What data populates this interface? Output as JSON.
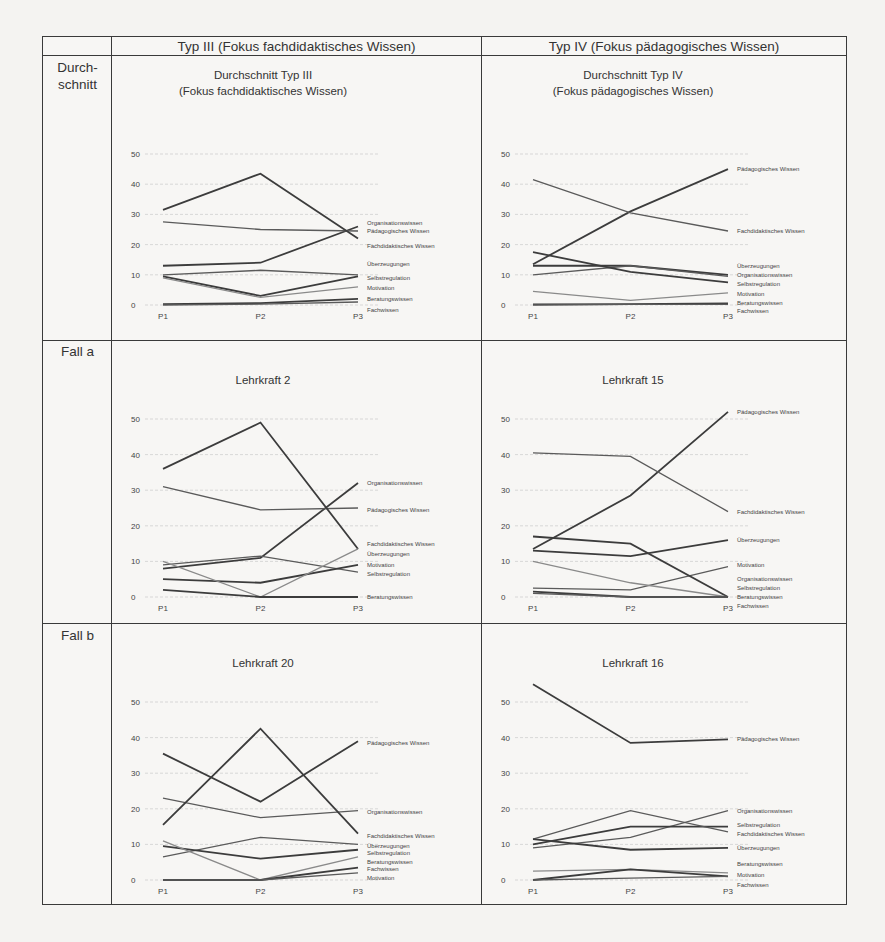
{
  "table": {
    "column_headers": [
      "Typ III (Fokus fachdidaktisches Wissen)",
      "Typ IV (Fokus pädagogisches Wissen)"
    ],
    "row_headers": [
      "Durch-\nschnitt",
      "Fall a",
      "Fall b"
    ]
  },
  "chart_data": [
    {
      "id": "avg_typ3",
      "type": "line",
      "title": "Durchschnitt Typ III",
      "subtitle": "(Fokus fachdidaktisches Wissen)",
      "categories": [
        "P1",
        "P2",
        "P3"
      ],
      "ylim": [
        0,
        50
      ],
      "yticks": [
        0,
        10,
        20,
        30,
        40,
        50
      ],
      "grid": true,
      "legend_position": "right-inline",
      "series": [
        {
          "name": "Organisationswissen",
          "values": [
            13,
            14,
            26
          ],
          "label_y": 27
        },
        {
          "name": "Pädagogisches Wissen",
          "values": [
            27.5,
            25,
            24.5
          ],
          "label_y": 24.5
        },
        {
          "name": "Fachdidaktisches Wissen",
          "values": [
            31.5,
            43.5,
            22
          ],
          "label_y": 19.5
        },
        {
          "name": "Überzeugungen",
          "values": [
            10,
            11.5,
            10
          ],
          "label_y": 13.5
        },
        {
          "name": "Selbstregulation",
          "values": [
            9.5,
            3,
            9.5
          ],
          "label_y": 9
        },
        {
          "name": "Motivation",
          "values": [
            9,
            2.5,
            6
          ],
          "label_y": 5.5
        },
        {
          "name": "Beratungswissen",
          "values": [
            0.3,
            0.6,
            2
          ],
          "label_y": 2
        },
        {
          "name": "Fachwissen",
          "values": [
            0,
            0.3,
            1
          ],
          "label_y": -1.5
        }
      ]
    },
    {
      "id": "avg_typ4",
      "type": "line",
      "title": "Durchschnitt Typ IV",
      "subtitle": "(Fokus pädagogisches Wissen)",
      "categories": [
        "P1",
        "P2",
        "P3"
      ],
      "ylim": [
        0,
        50
      ],
      "yticks": [
        0,
        10,
        20,
        30,
        40,
        50
      ],
      "grid": true,
      "legend_position": "right-inline",
      "series": [
        {
          "name": "Pädagogisches Wissen",
          "values": [
            13.5,
            31,
            45
          ],
          "label_y": 45
        },
        {
          "name": "Fachdidaktisches Wissen",
          "values": [
            41.5,
            30.5,
            24.5
          ],
          "label_y": 24.5
        },
        {
          "name": "Überzeugungen",
          "values": [
            13,
            13,
            10
          ],
          "label_y": 13
        },
        {
          "name": "Organisationswissen",
          "values": [
            10,
            13,
            9.5
          ],
          "label_y": 10
        },
        {
          "name": "Selbstregulation",
          "values": [
            17.5,
            11,
            7.5
          ],
          "label_y": 7
        },
        {
          "name": "Motivation",
          "values": [
            4.5,
            1.5,
            4
          ],
          "label_y": 3.5
        },
        {
          "name": "Beratungswissen",
          "values": [
            0.2,
            0.3,
            0.5
          ],
          "label_y": 0.5
        },
        {
          "name": "Fachwissen",
          "values": [
            0,
            0.2,
            0.2
          ],
          "label_y": -2
        }
      ]
    },
    {
      "id": "lehrkraft_2",
      "type": "line",
      "title": "Lehrkraft 2",
      "categories": [
        "P1",
        "P2",
        "P3"
      ],
      "ylim": [
        0,
        50
      ],
      "yticks": [
        0,
        10,
        20,
        30,
        40,
        50
      ],
      "grid": true,
      "legend_position": "right-inline",
      "series": [
        {
          "name": "Organisationswissen",
          "values": [
            8,
            11,
            32
          ],
          "label_y": 32
        },
        {
          "name": "Pädagogisches Wissen",
          "values": [
            31,
            24.5,
            25
          ],
          "label_y": 24.5
        },
        {
          "name": "Fachdidaktisches Wissen",
          "values": [
            36,
            49,
            13.5
          ],
          "label_y": 15
        },
        {
          "name": "Überzeugungen",
          "values": [
            9,
            11.5,
            7
          ],
          "label_y": 12
        },
        {
          "name": "Motivation",
          "values": [
            5,
            4,
            9
          ],
          "label_y": 9
        },
        {
          "name": "Selbstregulation",
          "values": [
            10,
            0,
            13.5
          ],
          "label_y": 6.5
        },
        {
          "name": "Beratungswissen",
          "values": [
            2,
            0,
            0
          ],
          "label_y": 0
        }
      ]
    },
    {
      "id": "lehrkraft_15",
      "type": "line",
      "title": "Lehrkraft 15",
      "categories": [
        "P1",
        "P2",
        "P3"
      ],
      "ylim": [
        0,
        50
      ],
      "yticks": [
        0,
        10,
        20,
        30,
        40,
        50
      ],
      "grid": true,
      "legend_position": "right-inline",
      "series": [
        {
          "name": "Pädagogisches Wissen",
          "values": [
            13.5,
            28.5,
            52
          ],
          "label_y": 52
        },
        {
          "name": "Fachdidaktisches Wissen",
          "values": [
            40.5,
            39.5,
            24
          ],
          "label_y": 24
        },
        {
          "name": "Überzeugungen",
          "values": [
            13,
            11.5,
            16
          ],
          "label_y": 16
        },
        {
          "name": "Motivation",
          "values": [
            2.5,
            2,
            8.5
          ],
          "label_y": 9
        },
        {
          "name": "Organisationswissen",
          "values": [
            17,
            15,
            0
          ],
          "label_y": 5
        },
        {
          "name": "Selbstregulation",
          "values": [
            10,
            4,
            0
          ],
          "label_y": 2.5
        },
        {
          "name": "Beratungswissen",
          "values": [
            1.5,
            0,
            0
          ],
          "label_y": 0
        },
        {
          "name": "Fachwissen",
          "values": [
            1,
            0,
            0
          ],
          "label_y": -2.5
        }
      ]
    },
    {
      "id": "lehrkraft_20",
      "type": "line",
      "title": "Lehrkraft 20",
      "categories": [
        "P1",
        "P2",
        "P3"
      ],
      "ylim": [
        0,
        50
      ],
      "yticks": [
        0,
        10,
        20,
        30,
        40,
        50
      ],
      "grid": true,
      "legend_position": "right-inline",
      "series": [
        {
          "name": "Pädagogisches Wissen",
          "values": [
            35.5,
            22,
            39
          ],
          "label_y": 38.5
        },
        {
          "name": "Organisationswissen",
          "values": [
            23,
            17.5,
            19.5
          ],
          "label_y": 19
        },
        {
          "name": "Fachdidaktisches Wissen",
          "values": [
            15.5,
            42.5,
            13
          ],
          "label_y": 12.5
        },
        {
          "name": "Überzeugungen",
          "values": [
            6.5,
            12,
            10
          ],
          "label_y": 9.5
        },
        {
          "name": "Selbstregulation",
          "values": [
            9.5,
            6,
            8.5
          ],
          "label_y": 7.5
        },
        {
          "name": "Beratungswissen",
          "values": [
            11,
            0,
            6.5
          ],
          "label_y": 5
        },
        {
          "name": "Fachwissen",
          "values": [
            0,
            0,
            3.5
          ],
          "label_y": 3
        },
        {
          "name": "Motivation",
          "values": [
            0,
            0,
            2
          ],
          "label_y": 0.5
        }
      ]
    },
    {
      "id": "lehrkraft_16",
      "type": "line",
      "title": "Lehrkraft 16",
      "categories": [
        "P1",
        "P2",
        "P3"
      ],
      "ylim": [
        0,
        50
      ],
      "yticks": [
        0,
        10,
        20,
        30,
        40,
        50
      ],
      "grid": true,
      "legend_position": "right-inline",
      "series": [
        {
          "name": "Pädagogisches Wissen",
          "values": [
            55,
            38.5,
            39.5
          ],
          "label_y": 39.5
        },
        {
          "name": "Organisationswissen",
          "values": [
            9,
            12,
            19.5
          ],
          "label_y": 19.5
        },
        {
          "name": "Selbstregulation",
          "values": [
            10,
            15,
            15
          ],
          "label_y": 15.5
        },
        {
          "name": "Fachdidaktisches Wissen",
          "values": [
            11.5,
            19.5,
            13.5
          ],
          "label_y": 13
        },
        {
          "name": "Überzeugungen",
          "values": [
            11.5,
            8.5,
            9
          ],
          "label_y": 9
        },
        {
          "name": "Beratungswissen",
          "values": [
            2.5,
            3,
            2
          ],
          "label_y": 4.5
        },
        {
          "name": "Motivation",
          "values": [
            0,
            3,
            1
          ],
          "label_y": 1.5
        },
        {
          "name": "Fachwissen",
          "values": [
            0,
            0.5,
            1
          ],
          "label_y": -1.5
        }
      ]
    }
  ],
  "colors": {
    "line_dark": "#3c3c3c",
    "line_mid": "#5a5a5a",
    "line_light": "#8a8a8a",
    "grid": "#cfcfcf",
    "border": "#3a3a3a",
    "background": "#f7f6f4"
  }
}
